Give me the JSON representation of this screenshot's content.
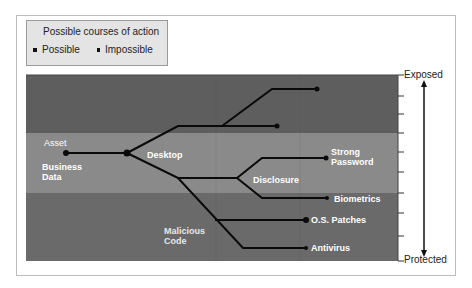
{
  "legend": {
    "title": "Possible courses of action",
    "items": [
      {
        "label": "Possible",
        "marker": "large-dot"
      },
      {
        "label": "Impossible",
        "marker": "small-dot"
      }
    ]
  },
  "axis": {
    "top_label": "Exposed",
    "bottom_label": "Protected"
  },
  "bands": [
    {
      "name": "top",
      "color": "#5e5e5e"
    },
    {
      "name": "middle",
      "color": "#8a8a8a"
    },
    {
      "name": "bottom",
      "color": "#6a6a6a"
    }
  ],
  "nodes": {
    "asset_header": "Asset",
    "asset": "Business Data",
    "asset_line1": "Business",
    "asset_line2": "Data",
    "desktop": "Desktop",
    "disclosure": "Disclosure",
    "malicious_line1": "Malicious",
    "malicious_line2": "Code",
    "strong_line1": "Strong",
    "strong_line2": "Password",
    "biometrics": "Biometrics",
    "os_patches": "O.S. Patches",
    "antivirus": "Antivirus"
  }
}
